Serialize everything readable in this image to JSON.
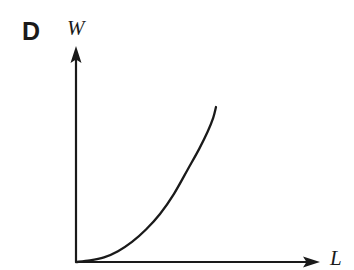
{
  "figure": {
    "panel_letter": "D",
    "background_color": "#ffffff",
    "ink_color": "#1a1a1a"
  },
  "axes": {
    "y_label": "W",
    "x_label": "L",
    "origin": {
      "x": 76,
      "y": 262
    },
    "y_axis_tip": {
      "x": 76,
      "y": 48
    },
    "x_axis_tip": {
      "x": 318,
      "y": 262
    },
    "arrowheads": true,
    "ticks": false,
    "tick_labels": [],
    "grid": false
  },
  "chart_data": {
    "type": "line",
    "title": "",
    "xlabel": "L",
    "ylabel": "W",
    "grid": false,
    "legend": null,
    "series": [
      {
        "name": "W vs L",
        "description": "monotonically increasing convex curve rising steeply at high L",
        "x": [
          0.0,
          0.1,
          0.2,
          0.3,
          0.4,
          0.5,
          0.6,
          0.7,
          0.8,
          0.88,
          0.94,
          0.98,
          1.0
        ],
        "y": [
          0.0,
          0.01,
          0.03,
          0.07,
          0.13,
          0.21,
          0.31,
          0.44,
          0.6,
          0.73,
          0.84,
          0.93,
          1.0
        ]
      }
    ],
    "xlim": [
      0,
      1
    ],
    "ylim": [
      0,
      1
    ]
  },
  "curve_path": "M 76 262 C 120 261, 160 245, 186 205 C 203 178, 212 140, 216 107"
}
